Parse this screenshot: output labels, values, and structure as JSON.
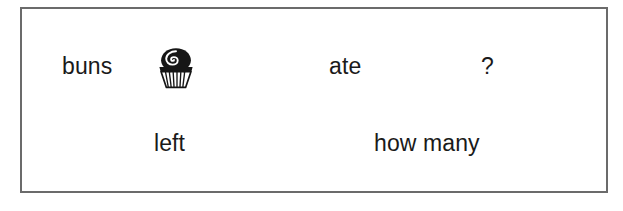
{
  "page": {
    "background_color": "#ffffff",
    "width": 623,
    "height": 211
  },
  "problem_frame": {
    "border_color": "#6b6b6b",
    "border_width_px": 2,
    "fill_color": "#ffffff"
  },
  "sentence_frame": {
    "text_color": "#1a1a1a",
    "top_row": {
      "subject_noun": "buns",
      "picture_label": "bun-cupcake",
      "verb": "ate",
      "question_mark": "?"
    },
    "bottom_row": {
      "hint_left": "left",
      "hint_quantity": "how many"
    }
  },
  "illustration": {
    "name": "bun-cupcake",
    "description": "iced bun in a fluted paper case with a swirl on top",
    "ink_color": "#161616",
    "paper_color": "#ffffff"
  }
}
